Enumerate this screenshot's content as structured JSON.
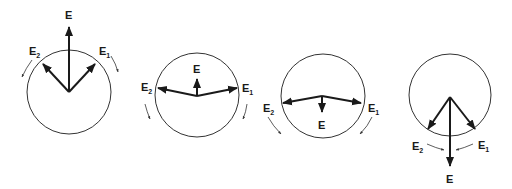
{
  "figure": {
    "panels": [
      {
        "id": 1,
        "resultant_label": "E",
        "left_label": "E",
        "left_sub": "2",
        "right_label": "E",
        "right_sub": "1",
        "resultant_direction": "up",
        "resultant_magnitude": "large"
      },
      {
        "id": 2,
        "resultant_label": "E",
        "left_label": "E",
        "left_sub": "2",
        "right_label": "E",
        "right_sub": "1",
        "resultant_direction": "up",
        "resultant_magnitude": "small"
      },
      {
        "id": 3,
        "resultant_label": "E",
        "left_label": "E",
        "left_sub": "2",
        "right_label": "E",
        "right_sub": "1",
        "resultant_direction": "down",
        "resultant_magnitude": "small"
      },
      {
        "id": 4,
        "resultant_label": "E",
        "left_label": "E",
        "left_sub": "2",
        "right_label": "E",
        "right_sub": "1",
        "resultant_direction": "down",
        "resultant_magnitude": "large"
      }
    ],
    "colors": {
      "line": "#1a1a1a",
      "circle": "#333333",
      "background": "#ffffff"
    }
  }
}
